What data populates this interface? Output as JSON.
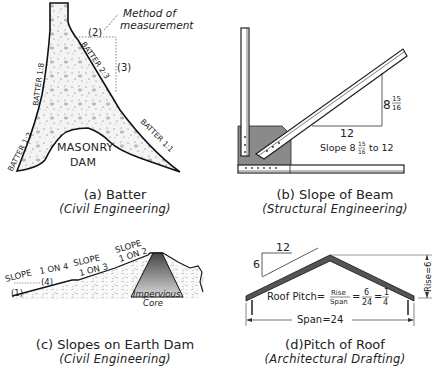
{
  "panels": {
    "a": {
      "caption": "(a) Batter",
      "subcaption": "(Civil Engineering)",
      "labels": {
        "method": "Method of",
        "method2": "measurement",
        "two": "(2)",
        "three": "(3)",
        "batter_2_3": "BATTER 2:3",
        "batter_1_8": "BATTER 1:8",
        "batter_1_2": "BATTER 1:2",
        "batter_1_1": "BATTER 1:1",
        "masonry": "MASONRY",
        "dam": "DAM"
      }
    },
    "b": {
      "caption": "(b) Slope of Beam",
      "subcaption": "(Structural Engineering)",
      "labels": {
        "rise_whole": "8",
        "rise_num": "15",
        "rise_den": "16",
        "run": "12",
        "slope_prefix": "Slope 8",
        "slope_suffix": "to 12"
      }
    },
    "c": {
      "caption": "(c) Slopes on Earth Dam",
      "subcaption": "(Civil Engineering)",
      "labels": {
        "slope1": "SLOPE",
        "one": "(1)",
        "on4": "1 ON 4",
        "four": "(4)",
        "slope2": "SLOPE",
        "on3": "1 ON 3",
        "slope3": "SLOPE",
        "on2": "1 ON 2",
        "impervious": "Impervious",
        "core": "Core"
      }
    },
    "d": {
      "caption": "(d)Pitch of Roof",
      "subcaption": "(Architectural Drafting)",
      "labels": {
        "run": "12",
        "rise": "6",
        "pitch_prefix": "Roof Pitch=",
        "frac1_num": "Rise",
        "frac1_den": "Span",
        "frac2_num": "6",
        "frac2_den": "24",
        "frac3_num": "1",
        "frac3_den": "4",
        "span": "Span=24",
        "rise_dim": "Rise=6"
      }
    }
  }
}
